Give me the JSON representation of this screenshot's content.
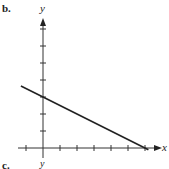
{
  "labels": {
    "part_b": "b.",
    "part_c": "c.",
    "next_y_label": "y"
  },
  "chart_data": {
    "type": "line",
    "title": "",
    "xlabel": "x",
    "ylabel": "y",
    "xlim": [
      -1,
      6.5
    ],
    "ylim": [
      0,
      7.5
    ],
    "grid": false,
    "x_ticks": [
      -1,
      1,
      2,
      3,
      4,
      5,
      6
    ],
    "y_ticks": [
      1,
      2,
      3,
      4,
      5,
      6,
      7
    ],
    "tick_labels_shown": false,
    "series": [
      {
        "name": "line",
        "x": [
          -1.3,
          0,
          6.2
        ],
        "y": [
          3.65,
          3,
          -0.1
        ],
        "color": "#222222"
      }
    ],
    "annotations": []
  }
}
